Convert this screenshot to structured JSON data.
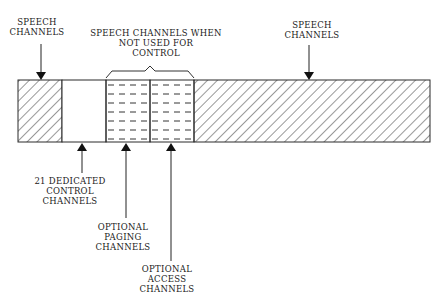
{
  "diagram": {
    "labels": {
      "speech_left": {
        "line1": "SPEECH",
        "line2": "CHANNELS"
      },
      "speech_when_not_used": {
        "line1": "SPEECH CHANNELS WHEN",
        "line2": "NOT USED FOR",
        "line3": "CONTROL"
      },
      "speech_right": {
        "line1": "SPEECH",
        "line2": "CHANNELS"
      },
      "dedicated_control": {
        "line1": "21 DEDICATED",
        "line2": "CONTROL",
        "line3": "CHANNELS"
      },
      "optional_paging": {
        "line1": "OPTIONAL",
        "line2": "PAGING",
        "line3": "CHANNELS"
      },
      "optional_access": {
        "line1": "OPTIONAL",
        "line2": "ACCESS",
        "line3": "CHANNELS"
      }
    },
    "segments": [
      {
        "name": "speech-channels-left",
        "pattern": "diagonal-hatch"
      },
      {
        "name": "dedicated-control-channels",
        "pattern": "blank"
      },
      {
        "name": "optional-paging-channels",
        "pattern": "horizontal-dashes"
      },
      {
        "name": "optional-access-channels",
        "pattern": "horizontal-dashes"
      },
      {
        "name": "speech-channels-right",
        "pattern": "diagonal-hatch"
      }
    ],
    "colors": {
      "line": "#2a2a2a",
      "background": "#ffffff"
    }
  }
}
